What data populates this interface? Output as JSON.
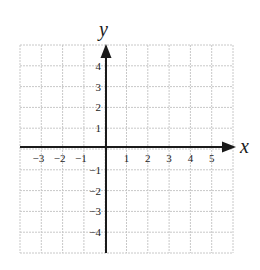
{
  "chart_data": {
    "type": "scatter",
    "title": "",
    "xlabel": "x",
    "ylabel": "y",
    "xlim": [
      -4,
      6
    ],
    "ylim": [
      -5,
      5
    ],
    "grid": true,
    "x_ticks": [
      -3,
      -2,
      -1,
      1,
      2,
      3,
      4,
      5
    ],
    "y_ticks": [
      4,
      3,
      2,
      1,
      -1,
      -2,
      -3,
      -4
    ],
    "x_tick_labels": [
      "−3",
      "−2",
      "−1",
      "1",
      "2",
      "3",
      "4",
      "5"
    ],
    "y_tick_labels": [
      "4",
      "3",
      "2",
      "1",
      "−1",
      "−2",
      "−3",
      "−4"
    ],
    "series": [],
    "annotations": [
      "x-axis arrow pointing right",
      "y-axis arrow pointing up"
    ]
  },
  "colors": {
    "grid": "#c8c8c8",
    "axis": "#1a1a1a",
    "text": "#222222"
  }
}
